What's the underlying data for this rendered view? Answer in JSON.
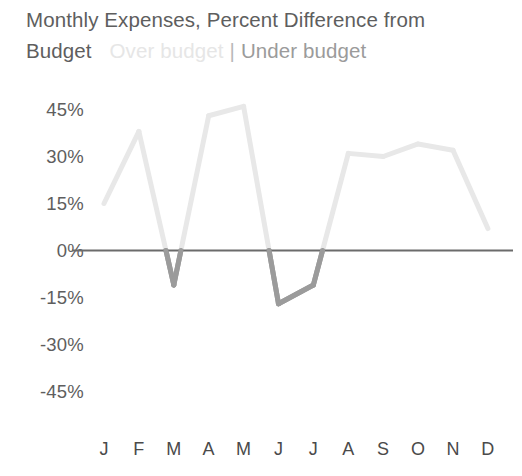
{
  "chart_data": {
    "type": "line",
    "title": "Monthly Expenses, Percent Difference from Budget",
    "title_line1": "Monthly Expenses, Percent Difference from",
    "title_line2": "Budget",
    "xlabel": "",
    "ylabel": "",
    "categories": [
      "J",
      "F",
      "M",
      "A",
      "M",
      "J",
      "J",
      "A",
      "S",
      "O",
      "N",
      "D"
    ],
    "month_names": [
      "January",
      "February",
      "March",
      "April",
      "May",
      "June",
      "July",
      "August",
      "September",
      "October",
      "November",
      "December"
    ],
    "values": [
      15,
      38,
      -11,
      43,
      46,
      -17,
      -11,
      31,
      30,
      34,
      32,
      7
    ],
    "ylim": [
      -45,
      45
    ],
    "ytick_values": [
      45,
      30,
      15,
      0,
      -15,
      -30,
      -45
    ],
    "ytick_labels": [
      "45%",
      "30%",
      "15%",
      "0%",
      "-15%",
      "-30%",
      "-45%"
    ],
    "grid": false,
    "zero_line": true,
    "legend_position": "title-inline",
    "legend": [
      {
        "label": "Over budget",
        "color": "#e6e6e6",
        "name": "legend-over-budget"
      },
      {
        "label": "Under budget",
        "color": "#9b9b9b",
        "name": "legend-under-budget"
      }
    ],
    "separator": "|",
    "colors": {
      "over_budget_line": "#e8e8e8",
      "under_budget_line": "#9b9b9b",
      "zero_axis": "#6b6b6b",
      "tick_text": "#5e5e5e",
      "title_text": "#5e5e5e",
      "background": "#ffffff"
    },
    "line_width": 5
  }
}
